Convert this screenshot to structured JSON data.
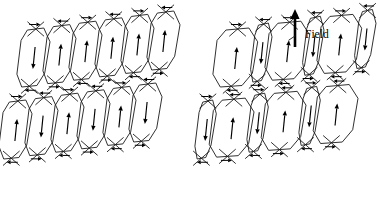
{
  "figure": {
    "background_color": "#ffffff",
    "line_color": "#1a1a1a",
    "arrow_color": "#000000",
    "width": 380,
    "height": 204
  },
  "annotations": {
    "field_label": "Field",
    "field_arrow": {
      "name": "field-direction-arrow",
      "direction": "up",
      "x": 295,
      "y_tail": 47,
      "y_tip": 9
    }
  },
  "panels": [
    {
      "id": "left",
      "name": "zero-field-panel",
      "caption": "",
      "origin_x": 22,
      "origin_y": 30,
      "cell_width": 26,
      "cell_height": 54,
      "shear_x": 15,
      "shear_y": -14,
      "columns": 6,
      "rows": 2,
      "equal_widths": true,
      "rows_data": [
        {
          "row": 0,
          "moments": [
            "down",
            "up",
            "up",
            "up",
            "up",
            "up"
          ],
          "widths": [
            1,
            1,
            1,
            1,
            1,
            1
          ]
        },
        {
          "row": 1,
          "moments": [
            "up",
            "down",
            "up",
            "down",
            "up",
            "down"
          ],
          "widths": [
            1,
            1,
            1,
            1,
            1,
            1
          ]
        }
      ]
    },
    {
      "id": "right",
      "name": "applied-field-panel",
      "caption": "Field",
      "origin_x": 218,
      "origin_y": 30,
      "cell_width": 26,
      "cell_height": 54,
      "shear_x": 15,
      "shear_y": -14,
      "columns": 6,
      "rows": 2,
      "equal_widths": false,
      "rows_data": [
        {
          "row": 0,
          "moments": [
            "up",
            "down",
            "up",
            "down",
            "up",
            "down"
          ],
          "widths": [
            1.45,
            0.55,
            1.45,
            0.55,
            1.45,
            0.55
          ]
        },
        {
          "row": 1,
          "moments": [
            "down",
            "up",
            "down",
            "up",
            "down",
            "up"
          ],
          "widths": [
            0.55,
            1.45,
            0.55,
            1.45,
            0.55,
            1.45
          ]
        }
      ]
    }
  ],
  "legend": {
    "moment_up": "up",
    "moment_down": "down",
    "surface_closure": "horizontal closure arrow"
  }
}
